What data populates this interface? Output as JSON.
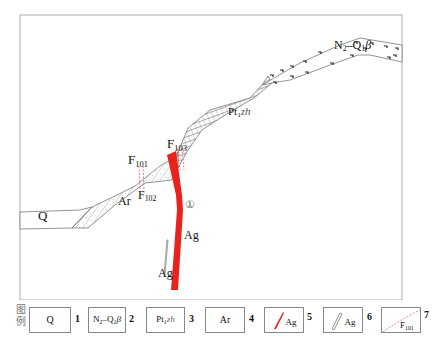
{
  "map": {
    "frame": {
      "x": 20,
      "y": 15,
      "width": 382,
      "height": 285,
      "stroke": "#999999"
    },
    "units": [
      {
        "id": "Q",
        "label": "Q",
        "pattern": "blank"
      },
      {
        "id": "Ar",
        "label": "Ar",
        "pattern": "diagonal-hatch-with-ticks"
      },
      {
        "id": "Pt1zh",
        "label_main": "Pt",
        "label_sub": "1",
        "label_suffix": "zh",
        "pattern": "grid-hatch"
      },
      {
        "id": "N2Q1b",
        "label_main": "N",
        "label_sub": "2",
        "label_mid": "–Q",
        "label_sub2": "1",
        "label_suffix": "β",
        "pattern": "basalt-ticks"
      }
    ],
    "labels": {
      "q": "Q",
      "ar": "Ar",
      "pt_main": "Pt",
      "pt_sub": "1",
      "pt_suffix": "zh",
      "n_main": "N",
      "n_sub": "2",
      "n_mid": "–Q",
      "n_sub2": "1",
      "n_suffix": "β",
      "f101_main": "F",
      "f101_sub": "101",
      "f102_main": "F",
      "f102_sub": "102",
      "f103_main": "F",
      "f103_sub": "103",
      "ag_main": "Ag",
      "ag_small": "Ag",
      "orebody_number": "①"
    },
    "colors": {
      "orebody_red": "#e8231e",
      "fault_red": "#e06060",
      "line": "#666666"
    }
  },
  "legend": {
    "title_line1": "图",
    "title_line2": "例",
    "items": [
      {
        "num": "1",
        "label": "Q"
      },
      {
        "num": "2",
        "main": "N",
        "sub": "2",
        "mid": "–Q",
        "sub2": "1",
        "suffix": "β"
      },
      {
        "num": "3",
        "main": "Pt",
        "sub": "1",
        "suffix": "zh"
      },
      {
        "num": "4",
        "label": "Ar"
      },
      {
        "num": "5",
        "label": "Ag",
        "symbol": "red-orebody"
      },
      {
        "num": "6",
        "label": "Ag",
        "symbol": "outline-orebody"
      },
      {
        "num": "7",
        "main": "F",
        "sub": "101",
        "symbol": "dashed-red-fault"
      }
    ]
  }
}
